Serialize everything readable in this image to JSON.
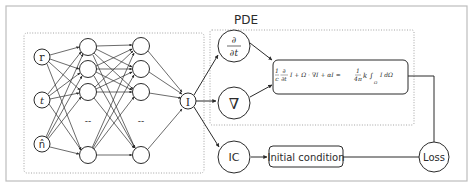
{
  "diagram": {
    "pde_label": "PDE",
    "inputs": [
      {
        "id": "r",
        "label": "r"
      },
      {
        "id": "t",
        "label": "t"
      },
      {
        "id": "n",
        "label": "n̂"
      }
    ],
    "hidden_ellipsis": "--",
    "output": {
      "label": "I"
    },
    "operators": [
      {
        "id": "dt",
        "num": "∂",
        "den": "∂t"
      },
      {
        "id": "grad",
        "label": "∇"
      },
      {
        "id": "ic",
        "label": "IC"
      }
    ],
    "equation": {
      "lhs_frac_num": "1",
      "lhs_frac_den": "c",
      "lhs_deriv_num": "∂",
      "lhs_deriv_den": "∂t",
      "lhs_rest": "I + Ω · ∇I + αI =",
      "rhs_frac_num": "1",
      "rhs_frac_den": "4π",
      "rhs_rest": "k ∫",
      "rhs_sub": "Ω",
      "rhs_tail": "I dΩ"
    },
    "initial_condition_label": "Initial condition",
    "loss_label": "Loss",
    "colors": {
      "stroke": "#2b2b2b",
      "frame": "#bdbdbd",
      "dotted": "#9a9a9a"
    }
  }
}
